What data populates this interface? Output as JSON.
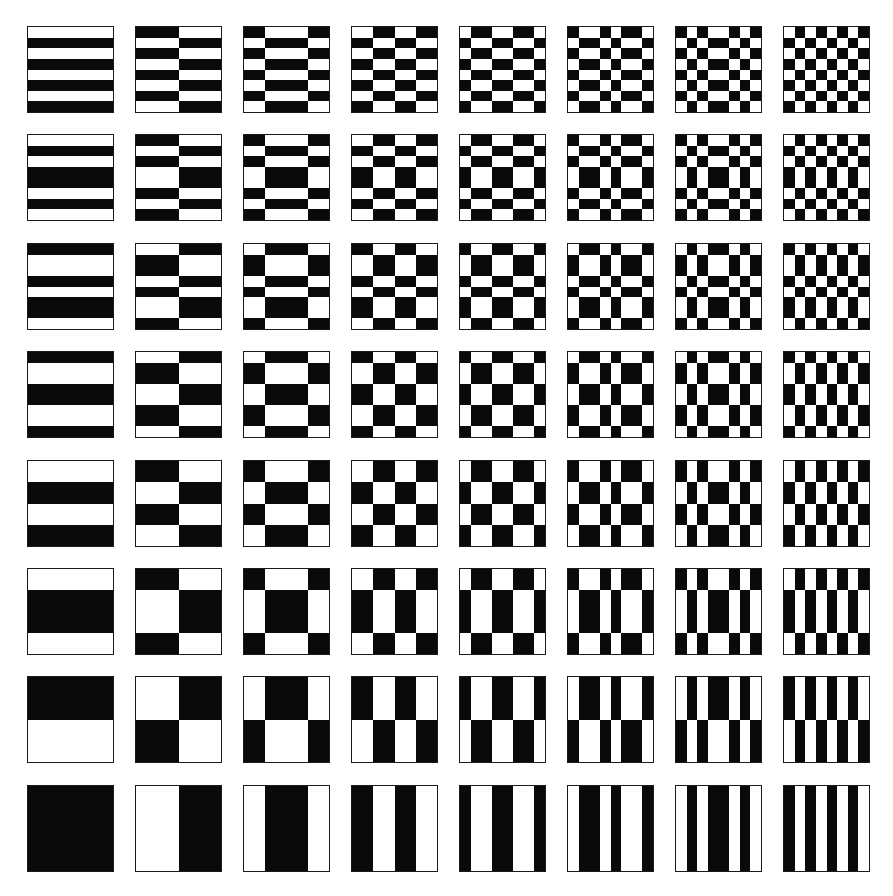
{
  "figure": {
    "grid_rows": 8,
    "grid_cols": 8,
    "cells_per_tile": 8,
    "colors": {
      "black": "#0a0a0a",
      "white": "#ffffff",
      "border": "#1a1a1a",
      "background": "#ffffff"
    },
    "layout": {
      "origin_x": 27,
      "origin_y": 26,
      "step_x": 108.0,
      "step_y": 108.4,
      "tile_size": 87
    }
  },
  "chart_data": {
    "type": "heatmap",
    "title": "",
    "xlabel": "",
    "ylabel": "",
    "legend": "none",
    "rule": "tile[r][c] pixel (y,x) is black when row_functions[r][y] equals col_functions[c][x], else white",
    "row_functions": [
      "WBWBWBWB",
      "WBWBBWBW",
      "BWWBWBBW",
      "BWWBBWWB",
      "WWBBWWBB",
      "WWBBBBWW",
      "BBBBWWWW",
      "BBBBBBBB"
    ],
    "col_functions": [
      "BBBBBBBB",
      "WWWWBBBB",
      "WWBBBBWW",
      "BBWWBBWW",
      "BWWBBWWB",
      "WBBWBWWB",
      "WBWBBWBW",
      "BWBWBWBW"
    ]
  }
}
